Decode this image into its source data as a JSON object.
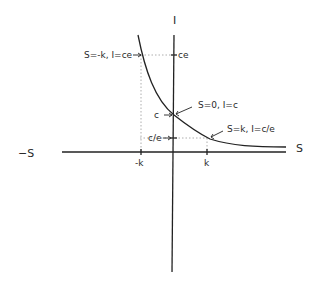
{
  "diagram": {
    "axes": {
      "x_positive_label": "S",
      "x_negative_label": "−S",
      "y_label": "I"
    },
    "x_ticks": [
      {
        "label": "-k"
      },
      {
        "label": "k"
      }
    ],
    "y_ticks": [
      {
        "label": "ce"
      },
      {
        "label": "c"
      },
      {
        "label": "c/e"
      }
    ],
    "annotations": [
      {
        "label": "S=-k, I=ce"
      },
      {
        "label": "S=0, I=c"
      },
      {
        "label": "S=k, I=c/e"
      }
    ],
    "curve": "decaying exponential I = c·e^(−S/k)"
  }
}
